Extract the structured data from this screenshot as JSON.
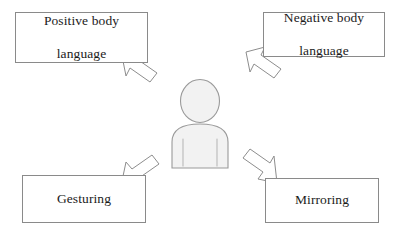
{
  "diagram": {
    "background_color": "#ffffff",
    "box_border_color": "#8a8a8a",
    "text_color": "#1b1b1b",
    "arrow_outline_color": "#8d8d8d",
    "figure_fill_color": "#f2f2f2",
    "figure_outline_color": "#9a9a9a",
    "center_figure_name": "person-silhouette",
    "boxes": [
      {
        "id": "positive-body-language",
        "label": "Positive body language",
        "line1": "Positive body",
        "line2": "language",
        "position": "top-left",
        "arrow_direction": "up-left"
      },
      {
        "id": "negative-body-language",
        "label": "Negative body language",
        "line1": "Negative body",
        "line2": "language",
        "position": "top-right",
        "arrow_direction": "up-left"
      },
      {
        "id": "gesturing",
        "label": "Gesturing",
        "line1": "Gesturing",
        "line2": "",
        "position": "bottom-left",
        "arrow_direction": "down-left"
      },
      {
        "id": "mirroring",
        "label": "Mirroring",
        "line1": "Mirroring",
        "line2": "",
        "position": "bottom-right",
        "arrow_direction": "down-right"
      }
    ],
    "arrows": [
      {
        "id": "arrow-to-positive",
        "direction": "up-left",
        "points_to": "positive-body-language"
      },
      {
        "id": "arrow-to-negative",
        "direction": "up-left",
        "points_to": "negative-body-language"
      },
      {
        "id": "arrow-to-gesturing",
        "direction": "down-left",
        "points_to": "gesturing"
      },
      {
        "id": "arrow-to-mirroring",
        "direction": "down-right",
        "points_to": "mirroring"
      }
    ]
  }
}
